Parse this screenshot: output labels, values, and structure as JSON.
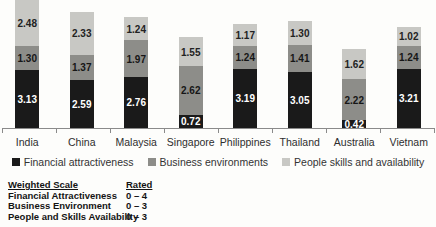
{
  "chart_data": {
    "type": "bar",
    "stacked": true,
    "title": "",
    "xlabel": "",
    "ylabel": "",
    "ylim": [
      0,
      7
    ],
    "grid": false,
    "legend_position": "bottom",
    "value_label_format": "2-decimals",
    "categories": [
      "India",
      "China",
      "Malaysia",
      "Singapore",
      "Philippines",
      "Thailand",
      "Australia",
      "Vietnam"
    ],
    "series": [
      {
        "name": "Financial attractiveness",
        "color": "#1a1a1a",
        "label_color": "#ffffff",
        "values": [
          3.13,
          2.59,
          2.76,
          0.72,
          3.19,
          3.05,
          0.42,
          3.21
        ]
      },
      {
        "name": "Business environments",
        "color": "#8d8d89",
        "label_color": "#161616",
        "values": [
          1.3,
          1.37,
          1.97,
          2.62,
          1.24,
          1.41,
          2.22,
          1.24
        ]
      },
      {
        "name": "People skills and availability",
        "color": "#c8c8c4",
        "label_color": "#222222",
        "values": [
          2.48,
          2.33,
          1.24,
          1.55,
          1.17,
          1.3,
          1.62,
          1.02
        ]
      }
    ]
  },
  "legend": {
    "items": [
      {
        "label": "Financial attractiveness"
      },
      {
        "label": "Business environments"
      },
      {
        "label": "People skills and availability"
      }
    ]
  },
  "scale_table": {
    "header": {
      "col1": "Weighted Scale",
      "col2": "Rated"
    },
    "rows": [
      {
        "label": "Financial Attractiveness",
        "rated": "0 – 4"
      },
      {
        "label": "Business Environment",
        "rated": "0 – 3"
      },
      {
        "label": "People and Skills Availability",
        "rated": "0 – 3"
      }
    ]
  },
  "colors": {
    "axis": "#8a8a8a",
    "category_text": "#2e2e2e",
    "background": "#fdfdfb"
  }
}
